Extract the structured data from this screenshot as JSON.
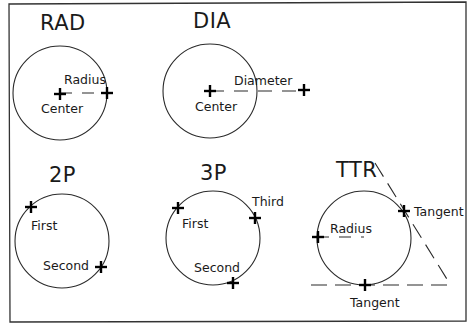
{
  "diagram": {
    "panels": [
      {
        "id": "rad",
        "title": "RAD",
        "labels": {
          "center": "Center",
          "radius": "Radius"
        }
      },
      {
        "id": "dia",
        "title": "DIA",
        "labels": {
          "center": "Center",
          "diameter": "Diameter"
        }
      },
      {
        "id": "2p",
        "title": "2P",
        "labels": {
          "first": "First",
          "second": "Second"
        }
      },
      {
        "id": "3p",
        "title": "3P",
        "labels": {
          "first": "First",
          "second": "Second",
          "third": "Third"
        }
      },
      {
        "id": "ttr",
        "title": "TTR",
        "labels": {
          "radius": "Radius",
          "tangent_1": "Tangent",
          "tangent_2": "Tangent"
        }
      }
    ]
  }
}
